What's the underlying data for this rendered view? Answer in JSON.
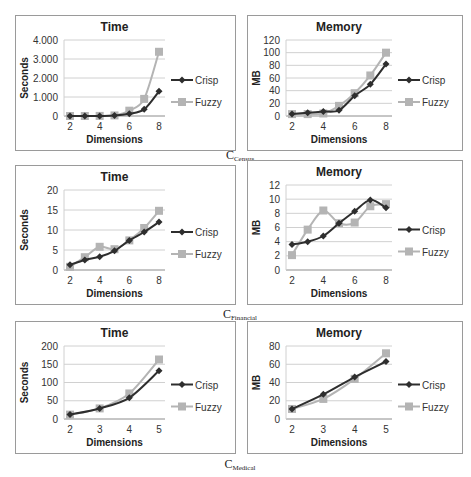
{
  "colors": {
    "crisp": "#2e2e2e",
    "fuzzy": "#b4b4b4",
    "grid": "#d0d0d0",
    "axis": "#8c8c8c",
    "panel_border": "#9a9a9a"
  },
  "captions": [
    {
      "main": "C",
      "sub": "Census"
    },
    {
      "main": "C",
      "sub": "Financial"
    },
    {
      "main": "C",
      "sub": "Medical"
    }
  ],
  "chart_data": [
    {
      "id": "census-time",
      "type": "line",
      "title": "Time",
      "xlabel": "Dimensions",
      "ylabel": "Seconds",
      "x": [
        2,
        3,
        4,
        5,
        6,
        7,
        8
      ],
      "xticks": [
        2,
        4,
        6,
        8
      ],
      "yticks": [
        "0",
        "1.000",
        "2.000",
        "3.000",
        "4.000"
      ],
      "ylim": [
        0,
        4000
      ],
      "grid": true,
      "legend_position": "right",
      "series": [
        {
          "name": "Crisp",
          "values": [
            0,
            0,
            5,
            20,
            120,
            350,
            1300
          ]
        },
        {
          "name": "Fuzzy",
          "values": [
            0,
            0,
            5,
            30,
            280,
            900,
            3380
          ]
        }
      ]
    },
    {
      "id": "census-memory",
      "type": "line",
      "title": "Memory",
      "xlabel": "Dimensions",
      "ylabel": "MB",
      "x": [
        2,
        3,
        4,
        5,
        6,
        7,
        8
      ],
      "xticks": [
        2,
        4,
        6,
        8
      ],
      "yticks": [
        "0",
        "20",
        "40",
        "60",
        "80",
        "100",
        "120"
      ],
      "ylim": [
        0,
        120
      ],
      "grid": true,
      "legend_position": "right",
      "series": [
        {
          "name": "Crisp",
          "values": [
            3,
            5,
            7,
            9,
            32,
            50,
            82
          ]
        },
        {
          "name": "Fuzzy",
          "values": [
            3,
            3,
            4,
            16,
            36,
            64,
            100
          ]
        }
      ]
    },
    {
      "id": "financial-time",
      "type": "line",
      "title": "Time",
      "xlabel": "Dimensions",
      "ylabel": "Seconds",
      "x": [
        2,
        3,
        4,
        5,
        6,
        7,
        8
      ],
      "xticks": [
        2,
        4,
        6,
        8
      ],
      "yticks": [
        "0",
        "5",
        "10",
        "15",
        "20"
      ],
      "ylim": [
        0,
        20
      ],
      "grid": true,
      "legend_position": "right",
      "series": [
        {
          "name": "Crisp",
          "values": [
            1.3,
            2.5,
            3.3,
            4.8,
            7.4,
            9.5,
            12.0
          ]
        },
        {
          "name": "Fuzzy",
          "values": [
            0.8,
            3.2,
            5.8,
            5.2,
            7.4,
            10.5,
            14.8
          ]
        }
      ]
    },
    {
      "id": "financial-memory",
      "type": "line",
      "title": "Memory",
      "xlabel": "Dimensions",
      "ylabel": "MB",
      "x": [
        2,
        3,
        4,
        5,
        6,
        7,
        8
      ],
      "xticks": [
        2,
        4,
        6,
        8
      ],
      "yticks": [
        "0",
        "2",
        "4",
        "6",
        "8",
        "10",
        "12"
      ],
      "ylim": [
        0,
        12
      ],
      "grid": true,
      "legend_position": "right",
      "series": [
        {
          "name": "Crisp",
          "values": [
            3.6,
            4.0,
            4.8,
            6.6,
            8.3,
            9.9,
            8.8
          ]
        },
        {
          "name": "Fuzzy",
          "values": [
            2.1,
            5.7,
            8.4,
            6.6,
            6.7,
            9.0,
            9.3
          ]
        }
      ]
    },
    {
      "id": "medical-time",
      "type": "line",
      "title": "Time",
      "xlabel": "Dimensions",
      "ylabel": "Seconds",
      "x": [
        2,
        3,
        4,
        5
      ],
      "xticks": [
        2,
        3,
        4,
        5
      ],
      "yticks": [
        "0",
        "50",
        "100",
        "150",
        "200"
      ],
      "ylim": [
        0,
        200
      ],
      "grid": true,
      "legend_position": "right",
      "series": [
        {
          "name": "Crisp",
          "values": [
            12,
            29,
            58,
            132
          ]
        },
        {
          "name": "Fuzzy",
          "values": [
            12,
            29,
            70,
            163
          ]
        }
      ]
    },
    {
      "id": "medical-memory",
      "type": "line",
      "title": "Memory",
      "xlabel": "Dimensions",
      "ylabel": "MB",
      "x": [
        2,
        3,
        4,
        5
      ],
      "xticks": [
        2,
        3,
        4,
        5
      ],
      "yticks": [
        "0",
        "20",
        "40",
        "60",
        "80"
      ],
      "ylim": [
        0,
        80
      ],
      "grid": true,
      "legend_position": "right",
      "series": [
        {
          "name": "Crisp",
          "values": [
            11,
            27,
            46,
            63
          ]
        },
        {
          "name": "Fuzzy",
          "values": [
            11,
            22,
            44,
            72
          ]
        }
      ]
    }
  ]
}
